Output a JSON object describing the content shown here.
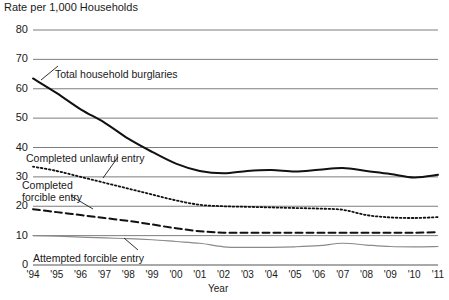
{
  "chart_data": {
    "type": "line",
    "title": "",
    "ylabel": "Rate per 1,000 Households",
    "xlabel": "Year",
    "grid": true,
    "legend_position": "inline-annotations",
    "ylim": [
      0,
      80
    ],
    "yticks": [
      0,
      10,
      20,
      30,
      40,
      50,
      60,
      70,
      80
    ],
    "ytick_labels": [
      "0",
      "10",
      "20",
      "30",
      "40",
      "50",
      "60",
      "70",
      "80"
    ],
    "categories": [
      "'94",
      "'95",
      "'96",
      "'97",
      "'98",
      "'99",
      "'00",
      "'01",
      "'02",
      "'03",
      "'04",
      "'05",
      "'06",
      "'07",
      "'08",
      "'09",
      "'10",
      "'11"
    ],
    "x": [
      1994,
      1995,
      1996,
      1997,
      1998,
      1999,
      2000,
      2001,
      2002,
      2003,
      2004,
      2005,
      2006,
      2007,
      2008,
      2009,
      2010,
      2011
    ],
    "series": [
      {
        "name": "Total household burglaries",
        "style": "solid",
        "color": "#111111",
        "width": 2.0,
        "values": [
          63.5,
          58.5,
          53.0,
          48.5,
          43.0,
          38.5,
          34.5,
          32.0,
          31.2,
          32.0,
          32.3,
          31.8,
          32.4,
          33.0,
          32.0,
          31.0,
          29.8,
          30.7
        ]
      },
      {
        "name": "Completed unlawful entry",
        "style": "dotted",
        "color": "#111111",
        "width": 1.8,
        "values": [
          33.5,
          32.0,
          30.0,
          28.0,
          26.0,
          24.0,
          22.0,
          20.5,
          20.0,
          19.8,
          19.6,
          19.4,
          19.2,
          18.8,
          17.0,
          16.2,
          16.0,
          16.3
        ]
      },
      {
        "name": "Completed forcible entry",
        "style": "dashed",
        "color": "#111111",
        "width": 2.0,
        "values": [
          19.0,
          18.0,
          17.0,
          16.0,
          15.0,
          13.8,
          12.5,
          11.5,
          11.0,
          11.0,
          11.0,
          11.0,
          11.0,
          11.0,
          11.0,
          11.0,
          11.0,
          11.2
        ]
      },
      {
        "name": "Attempted forcible entry",
        "style": "solid-thin",
        "color": "#8a8a8a",
        "width": 1.2,
        "values": [
          10.0,
          9.8,
          9.5,
          9.2,
          9.0,
          8.6,
          8.0,
          7.4,
          6.2,
          6.0,
          6.0,
          6.2,
          6.6,
          7.4,
          6.8,
          6.3,
          6.2,
          6.3
        ]
      }
    ],
    "annotations": [
      {
        "text": "Total household burglaries",
        "x_px": 55,
        "y_px": 68
      },
      {
        "text": "Completed unlawful entry",
        "x_px": 26,
        "y_px": 152
      },
      {
        "text": "Completed\nforcible entry",
        "x_px": 22,
        "y_px": 179
      },
      {
        "text": "Attempted forcible entry",
        "x_px": 33,
        "y_px": 252
      }
    ]
  }
}
